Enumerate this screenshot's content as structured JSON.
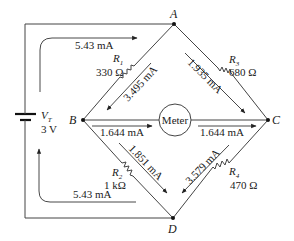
{
  "diagram": {
    "type": "wheatstone-bridge-circuit",
    "nodes": {
      "A": "A",
      "B": "B",
      "C": "C",
      "D": "D"
    },
    "source": {
      "label": "V",
      "subscript": "T",
      "value": "3 V"
    },
    "meter": {
      "label": "Meter"
    },
    "resistors": [
      {
        "id": "R1",
        "label": "R",
        "subscript": "1",
        "value": "330 Ω",
        "between": "A-B"
      },
      {
        "id": "R3",
        "label": "R",
        "subscript": "3",
        "value": "680 Ω",
        "between": "A-C"
      },
      {
        "id": "R2",
        "label": "R",
        "subscript": "2",
        "value": "1 kΩ",
        "between": "B-D"
      },
      {
        "id": "R4",
        "label": "R",
        "subscript": "4",
        "value": "470 Ω",
        "between": "C-D"
      }
    ],
    "currents": {
      "source_top": "5.43 mA",
      "source_bottom": "5.43 mA",
      "AB": "3.495 mA",
      "AC": "1.935 mA",
      "B_to_meter": "1.644 mA",
      "meter_to_C": "1.644 mA",
      "BD": "1.851 mA",
      "CD": "3.579 mA"
    }
  }
}
